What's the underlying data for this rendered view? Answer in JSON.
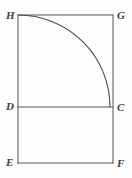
{
  "figure": {
    "kind": "geometry-diagram",
    "background_color": "#fefefe",
    "stroke_color": "#555555",
    "arc_stroke_color": "#4a4a4a",
    "stroke_width": 1,
    "label_color": "#3d3d3d",
    "vertices": [
      {
        "id": "H",
        "label": "H",
        "x": 18,
        "y": 15,
        "corner": "top-left"
      },
      {
        "id": "G",
        "label": "G",
        "x": 113,
        "y": 15,
        "corner": "top-right"
      },
      {
        "id": "D",
        "label": "D",
        "x": 18,
        "y": 107,
        "corner": "middle-left"
      },
      {
        "id": "C",
        "label": "C",
        "x": 113,
        "y": 107,
        "corner": "middle-right"
      },
      {
        "id": "E",
        "label": "E",
        "x": 18,
        "y": 163,
        "corner": "bottom-left"
      },
      {
        "id": "F",
        "label": "F",
        "x": 113,
        "y": 163,
        "corner": "bottom-right"
      }
    ],
    "segments": [
      {
        "id": "HG",
        "from": "H",
        "to": "G",
        "name": "top-edge"
      },
      {
        "id": "GF",
        "from": "G",
        "to": "F",
        "name": "right-edge"
      },
      {
        "id": "FE",
        "from": "F",
        "to": "E",
        "name": "bottom-edge"
      },
      {
        "id": "EH",
        "from": "E",
        "to": "H",
        "name": "left-edge"
      },
      {
        "id": "DC",
        "from": "D",
        "to": "C",
        "name": "divider-segment"
      }
    ],
    "arc": {
      "id": "arc-HC",
      "from": "H",
      "to": "C",
      "center": "D",
      "radius": 92,
      "sweep": "quarter-circle",
      "path": "M 18 15 A 92 92 0 0 1 110 107"
    }
  }
}
